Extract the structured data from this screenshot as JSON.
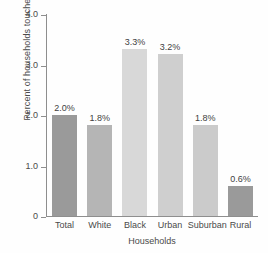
{
  "chart_data": {
    "type": "bar",
    "title": "",
    "subtitle": "",
    "xlabel": "Households",
    "ylabel": "Percent of households touched",
    "categories": [
      "Total",
      "White",
      "Black",
      "Urban",
      "Suburban",
      "Rural"
    ],
    "values": [
      2.0,
      1.8,
      3.3,
      3.2,
      1.8,
      0.6
    ],
    "data_labels": [
      "2.0%",
      "1.8%",
      "3.3%",
      "3.2%",
      "1.8%",
      "0.6%"
    ],
    "bar_colors": [
      "#9a9a9a",
      "#b5b5b5",
      "#d8d8d8",
      "#cfcfcf",
      "#cbcbcb",
      "#9a9a9a"
    ],
    "ylim": [
      0,
      4.0
    ],
    "yticks": [
      0,
      1.0,
      2.0,
      3.0,
      4.0
    ],
    "ytick_labels": [
      "0",
      "1.0",
      "2.0",
      "3.0",
      "4.0"
    ],
    "grid": false,
    "legend": null,
    "legend_position": "none",
    "axis_color": "#8e8e8e",
    "text_color": "#4a4a4a",
    "background": "#ffffff"
  }
}
